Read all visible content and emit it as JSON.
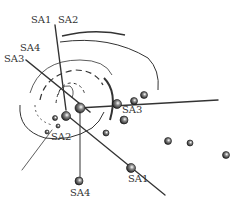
{
  "diagram": {
    "type": "molecular-structure-with-screw-axes",
    "line_color": "#333333",
    "labels": {
      "top_sa1": "SA1",
      "top_sa2": "SA2",
      "left_sa4": "SA4",
      "left_sa3": "SA3",
      "mid_sa3": "SA3",
      "mid_sa2": "SA2",
      "bottom_sa4": "SA4",
      "bottom_sa1": "SA1"
    }
  }
}
